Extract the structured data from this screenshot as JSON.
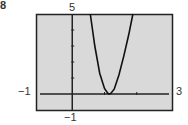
{
  "chart_data": {
    "type": "line",
    "title": "",
    "figure_label": "8",
    "xlabel": "",
    "ylabel": "",
    "xlim": [
      -1,
      3
    ],
    "ylim": [
      -1,
      5
    ],
    "x_tick_values": [
      1,
      2
    ],
    "y_tick_values": [
      1,
      2,
      3,
      4
    ],
    "window_labels": {
      "xmin": "−1",
      "xmax": "3",
      "ymin": "−1",
      "ymax": "5"
    },
    "grid": false,
    "background": "#d9d9d9",
    "series": [
      {
        "name": "curve",
        "color": "#111111",
        "x": [
          0.56,
          0.7,
          0.85,
          1.0,
          1.1,
          1.15,
          1.2,
          1.3,
          1.45,
          1.6,
          1.75,
          1.88
        ],
        "y": [
          5.0,
          3.0,
          1.3,
          0.35,
          0.05,
          0.0,
          0.05,
          0.3,
          1.2,
          2.4,
          3.7,
          5.0
        ]
      }
    ]
  }
}
